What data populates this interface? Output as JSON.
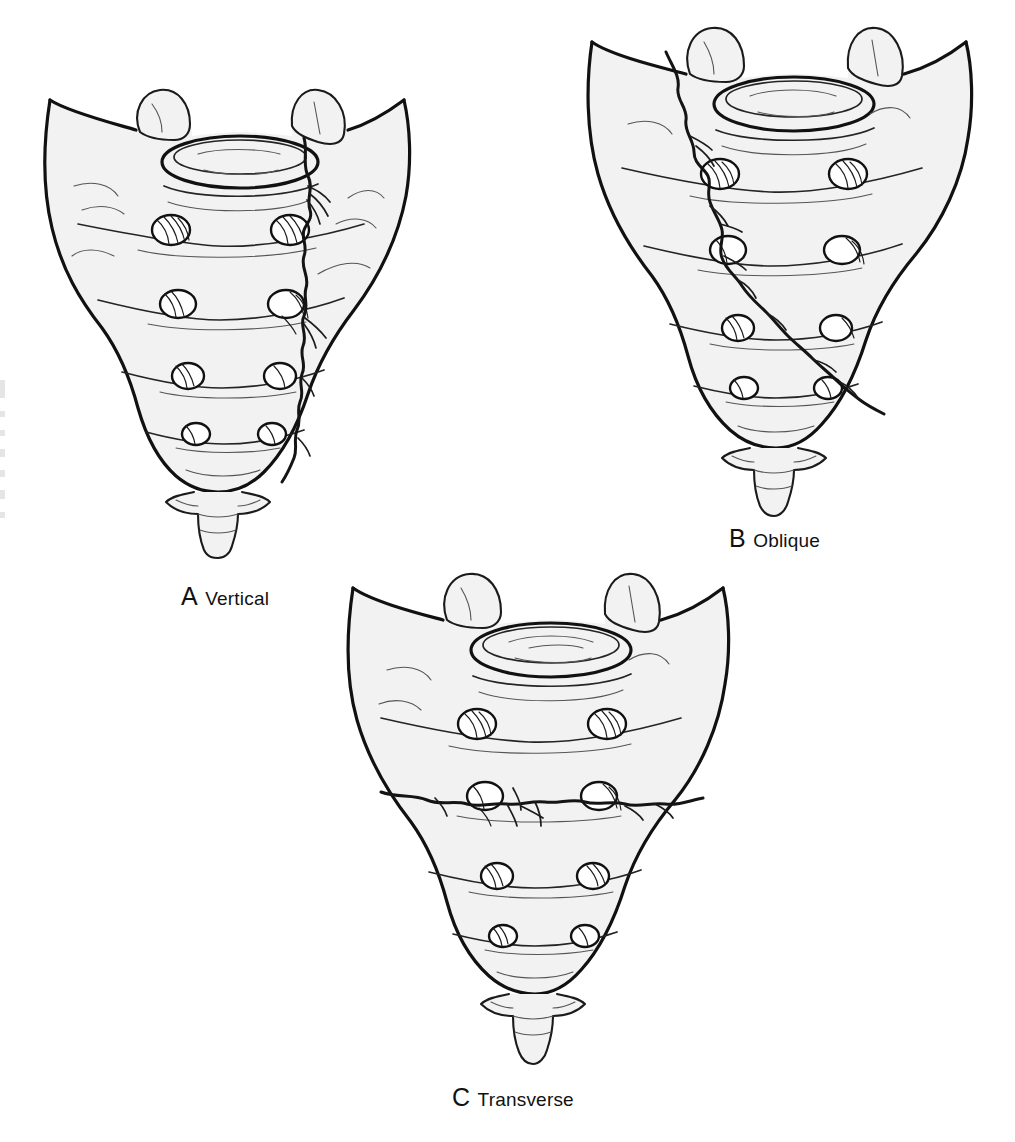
{
  "figure": {
    "kind": "medical-illustration",
    "background_color": "#ffffff",
    "ink_color": "#111111",
    "bone_fill_color": "#f2f2f2",
    "foramen_fill_color": "#ffffff"
  },
  "panels": [
    {
      "id": "a",
      "letter": "A",
      "label": "Vertical",
      "fracture_pattern": "vertical",
      "fracture_description": "Zigzag vertical fracture line descending through the right sacral foraminal column from the superior border to the lower sacrum",
      "foramina_rows": 4,
      "foramina_per_row": 2
    },
    {
      "id": "b",
      "letter": "B",
      "label": "Oblique",
      "fracture_pattern": "oblique",
      "fracture_description": "Oblique fracture line running diagonally from the superior-left border across the body to the inferior-right lateral margin",
      "foramina_rows": 4,
      "foramina_per_row": 2
    },
    {
      "id": "c",
      "letter": "C",
      "label": "Transverse",
      "fracture_pattern": "transverse",
      "fracture_description": "Horizontal transverse fracture line crossing the full width of the sacrum at the S2-S3 level through both foramina",
      "foramina_rows": 4,
      "foramina_per_row": 2
    }
  ],
  "anatomy_parts": [
    "sacral ala",
    "superior articular process",
    "S1 superior endplate",
    "anterior sacral foramina",
    "transverse ridges",
    "sacral apex",
    "coccyx"
  ]
}
